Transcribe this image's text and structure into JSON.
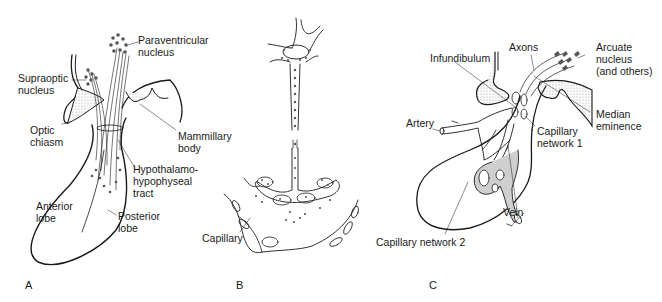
{
  "figure": {
    "panels": [
      {
        "id": "A",
        "letter": "A",
        "labels": {
          "paraventricular": "Paraventricular\nnucleus",
          "supraoptic": "Supraoptic\nnucleus",
          "optic_chiasm": "Optic\nchiasm",
          "mammillary": "Mammillary\nbody",
          "tract": "Hypothalamo-\nhypophyseal\ntract",
          "anterior": "Anterior\nlobe",
          "posterior": "Posterior\nlobe"
        }
      },
      {
        "id": "B",
        "letter": "B",
        "labels": {
          "capillary": "Capillary"
        }
      },
      {
        "id": "C",
        "letter": "C",
        "labels": {
          "axons": "Axons",
          "arcuate": "Arcuate\nnucleus\n(and others)",
          "infundibulum": "Infundibulum",
          "median": "Median\neminence",
          "artery": "Artery",
          "cap1": "Capillary\nnetwork 1",
          "vein": "Vein",
          "cap2": "Capillary network 2"
        }
      }
    ],
    "colors": {
      "line": "#1a1a1a",
      "stipple": "#d6d6d6",
      "vessel_fill": "#cfcfcf"
    }
  }
}
